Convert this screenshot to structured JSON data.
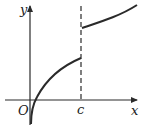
{
  "diagram": {
    "title": "",
    "axes": {
      "x_label": "x",
      "y_label": "y",
      "origin_label": "O"
    },
    "marker": {
      "label": "c",
      "style": "dashed vertical line"
    },
    "curves": [
      {
        "name": "left-branch",
        "description": "increasing concave-down curve from below origin up to x = c"
      },
      {
        "name": "right-branch",
        "description": "increasing curve starting above at x = c, continuing right"
      }
    ],
    "colors": {
      "stroke": "#2a2a2a",
      "background": "#ffffff"
    }
  }
}
